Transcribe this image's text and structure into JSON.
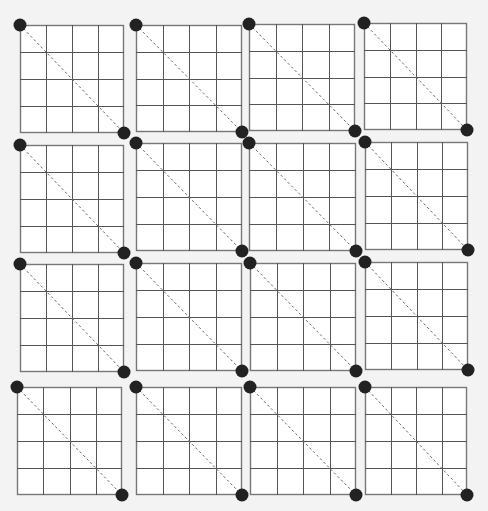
{
  "diagram": {
    "title": "",
    "background": "#f3f3f3",
    "panel_fill": "#ffffff",
    "grid_color": "#555555",
    "border_color": "#777777",
    "diagonal_color": "#666666",
    "dot_color": "#222222",
    "grid_divisions": 4,
    "dot_radius": 6.5,
    "panels": [
      {
        "row": 0,
        "col": 0,
        "x": 20,
        "y": 25,
        "w": 104,
        "h": 108
      },
      {
        "row": 0,
        "col": 1,
        "x": 136,
        "y": 25,
        "w": 106,
        "h": 107
      },
      {
        "row": 0,
        "col": 2,
        "x": 249,
        "y": 24,
        "w": 106,
        "h": 107
      },
      {
        "row": 0,
        "col": 3,
        "x": 364,
        "y": 23,
        "w": 103,
        "h": 107
      },
      {
        "row": 1,
        "col": 0,
        "x": 20,
        "y": 145,
        "w": 104,
        "h": 108
      },
      {
        "row": 1,
        "col": 1,
        "x": 136,
        "y": 143,
        "w": 106,
        "h": 108
      },
      {
        "row": 1,
        "col": 2,
        "x": 249,
        "y": 143,
        "w": 107,
        "h": 108
      },
      {
        "row": 1,
        "col": 3,
        "x": 365,
        "y": 142,
        "w": 103,
        "h": 108
      },
      {
        "row": 2,
        "col": 0,
        "x": 20,
        "y": 264,
        "w": 104,
        "h": 108
      },
      {
        "row": 2,
        "col": 1,
        "x": 136,
        "y": 263,
        "w": 106,
        "h": 108
      },
      {
        "row": 2,
        "col": 2,
        "x": 250,
        "y": 263,
        "w": 106,
        "h": 108
      },
      {
        "row": 2,
        "col": 3,
        "x": 365,
        "y": 262,
        "w": 103,
        "h": 108
      },
      {
        "row": 3,
        "col": 0,
        "x": 17,
        "y": 387,
        "w": 105,
        "h": 108
      },
      {
        "row": 3,
        "col": 1,
        "x": 136,
        "y": 387,
        "w": 106,
        "h": 108
      },
      {
        "row": 3,
        "col": 2,
        "x": 250,
        "y": 387,
        "w": 106,
        "h": 108
      },
      {
        "row": 3,
        "col": 3,
        "x": 365,
        "y": 387,
        "w": 102,
        "h": 108
      }
    ]
  }
}
